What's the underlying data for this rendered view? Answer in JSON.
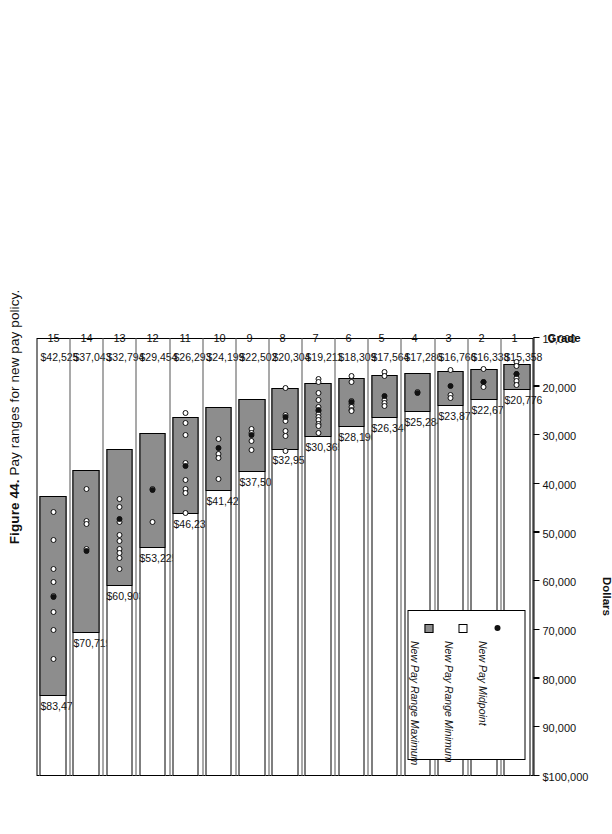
{
  "figure": {
    "number": "Figure 44.",
    "caption": "Pay ranges for new pay policy."
  },
  "axes": {
    "value_axis_title": "Dollars",
    "category_axis_title": "Grade",
    "value_ticks": [
      "$100,000",
      "90,000",
      "80,000",
      "70,000",
      "60,000",
      "50,000",
      "40,000",
      "30,000",
      "20,000",
      "10,000"
    ]
  },
  "legend": {
    "items": [
      {
        "label": "New Pay Range Maximum",
        "marker": "gray-square-swatch"
      },
      {
        "label": "New Pay Range Minimum",
        "marker": "white-square-swatch"
      },
      {
        "label": "New Pay Midpoint",
        "marker": "black-dot-marker"
      }
    ]
  },
  "chart_data": {
    "type": "bar",
    "title": "Figure 44. Pay ranges for new pay policy.",
    "xlabel": "Grade",
    "ylabel": "Dollars",
    "ylim": [
      10000,
      100000
    ],
    "grid": false,
    "legend_position": "bottom-left",
    "orientation": "horizontal-floating-bars",
    "categories": [
      "1",
      "2",
      "3",
      "4",
      "5",
      "6",
      "7",
      "8",
      "9",
      "10",
      "11",
      "12",
      "13",
      "14",
      "15"
    ],
    "series": [
      {
        "name": "New Pay Range Maximum",
        "values": [
          20776,
          22675,
          23878,
          25284,
          26346,
          28190,
          30365,
          32953,
          37503,
          41425,
          46239,
          53225,
          60903,
          70719,
          83475
        ]
      },
      {
        "name": "New Pay Range Minimum",
        "values": [
          15358,
          16338,
          16766,
          17286,
          17564,
          18309,
          19211,
          20304,
          22502,
          24199,
          26293,
          29454,
          32794,
          37043,
          42525
        ]
      }
    ],
    "max_labels": [
      "$20,776",
      "$22,675",
      "$23,878",
      "$25,284",
      "$26,346",
      "$28,190",
      "$30,365",
      "$32,953",
      "$37,503",
      "$41,425",
      "$46,239",
      "$53,225",
      "$60,903",
      "$70,719",
      "$83,475"
    ],
    "min_labels": [
      "$15,358",
      "$16,338",
      "$16,766",
      "$17,286",
      "$17,564",
      "$18,309",
      "$19,211",
      "$20,304",
      "$22,502",
      "$24,199",
      "$26,293",
      "$29,454",
      "$32,794",
      "$37,043",
      "$42,525"
    ],
    "midpoints": [
      17500,
      19100,
      19900,
      21200,
      21900,
      23100,
      24700,
      26300,
      29900,
      32600,
      36200,
      41200,
      47100,
      53800,
      63200
    ],
    "employee_salaries": [
      [
        15000,
        15700,
        17400,
        18300,
        18900,
        19600
      ],
      [
        16300,
        19000,
        20000
      ],
      [
        16600,
        21800,
        22400
      ],
      [
        21100
      ],
      [
        16900,
        17800,
        22700,
        23400,
        23900
      ],
      [
        17900,
        19000,
        23000,
        23600,
        24200,
        24700,
        25100
      ],
      [
        18500,
        19100,
        21200,
        22800,
        24100,
        25000,
        25600,
        26200,
        26900,
        27600,
        28100,
        29600
      ],
      [
        20200,
        25900,
        27000,
        29200,
        30100,
        33200
      ],
      [
        28700,
        29500,
        31100,
        33000
      ],
      [
        30800,
        33900,
        34600,
        38900
      ],
      [
        25500,
        27400,
        29900,
        35600,
        39200,
        41100,
        41900,
        45900
      ],
      [
        41000,
        47900
      ],
      [
        43100,
        44700,
        47900,
        50500,
        51700,
        53300,
        54100,
        55200,
        57400
      ],
      [
        41000,
        47600,
        48200,
        53400
      ],
      [
        45800,
        51600,
        57500,
        60200,
        63100,
        66400,
        69900,
        75900
      ]
    ]
  }
}
